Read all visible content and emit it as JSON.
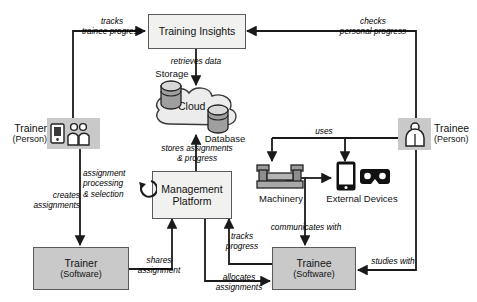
{
  "diagram": {
    "colors": {
      "box_light": "#f1f1ef",
      "box_gray": "#c9c9c9",
      "stroke": "#5a5a5a",
      "arrow": "#1a1a1a",
      "cloud_fill": "#ececec",
      "icon_dark": "#111111"
    }
  },
  "nodes": {
    "training_insights": {
      "title": "Training Insights",
      "sub": ""
    },
    "cloud": {
      "title": "Cloud",
      "storage_label": "Storage",
      "database_label": "Database"
    },
    "management_platform": {
      "line1": "Management",
      "line2": "Platform"
    },
    "trainer_person": {
      "title": "Trainer",
      "sub": "(Person)"
    },
    "trainee_person": {
      "title": "Trainee",
      "sub": "(Person)"
    },
    "trainer_software": {
      "title": "Trainer",
      "sub": "(Software)"
    },
    "trainee_software": {
      "title": "Trainee",
      "sub": "(Software)"
    },
    "machinery": {
      "title": "Machinery"
    },
    "external_devices": {
      "title": "External Devices"
    }
  },
  "edges": {
    "tracks_trainee_progress": {
      "line1": "tracks",
      "line2": "trainee progress"
    },
    "checks_personal_progress": {
      "line1": "checks",
      "line2": "personal progress"
    },
    "retrieves_data": {
      "line1": "retrieves data"
    },
    "stores_assignments_progress": {
      "line1": "stores assignments",
      "line2": "& progress"
    },
    "assignment_processing_selection": {
      "line1": "assignment",
      "line2": "processing",
      "line3": "& selection"
    },
    "creates_assignments": {
      "line1": "creates",
      "line2": "assignments"
    },
    "shares_assignment": {
      "line1": "shares",
      "line2": "assignment"
    },
    "tracks_progress": {
      "line1": "tracks",
      "line2": "progress"
    },
    "allocates_assignments": {
      "line1": "allocates",
      "line2": "assignments"
    },
    "uses": {
      "line1": "uses"
    },
    "communicates_with": {
      "line1": "communicates with"
    },
    "studies_with": {
      "line1": "studies with"
    }
  },
  "icons": {
    "trainer_person_icon": "trainer-people-icon",
    "trainee_person_icon": "single-person-icon",
    "machinery_icon": "machine-icon",
    "tablet_icon": "tablet-icon",
    "vr_icon": "vr-goggles-icon",
    "storage_icon": "database-cylinder-icon",
    "database_icon": "database-cylinder-icon",
    "cloud_icon": "cloud-icon",
    "self_loop_icon": "circular-arrow-icon"
  }
}
